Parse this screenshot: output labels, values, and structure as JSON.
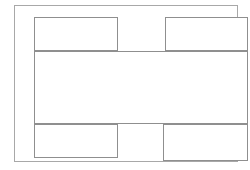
{
  "diagram": {
    "type": "wireframe-layout-diagram",
    "background_color": "#ffffff",
    "frame": {
      "name": "page-frame",
      "stroke_color": "#a8a8a8",
      "fill_color": "#ffffff",
      "label": ""
    },
    "regions": [
      {
        "id": "top-left",
        "label": "",
        "row": "top",
        "stroke_color": "#8f8f8f",
        "fill_color": "#ffffff"
      },
      {
        "id": "top-right",
        "label": "",
        "row": "top",
        "stroke_color": "#8f8f8f",
        "fill_color": "#ffffff"
      },
      {
        "id": "center",
        "label": "",
        "row": "middle",
        "stroke_color": "#8f8f8f",
        "fill_color": "#ffffff"
      },
      {
        "id": "bottom-left",
        "label": "",
        "row": "bottom",
        "stroke_color": "#8f8f8f",
        "fill_color": "#ffffff"
      },
      {
        "id": "bottom-right",
        "label": "",
        "row": "bottom",
        "stroke_color": "#8f8f8f",
        "fill_color": "#ffffff"
      }
    ]
  }
}
